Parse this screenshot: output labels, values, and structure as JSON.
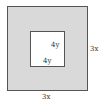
{
  "diagram": {
    "type": "nested-squares",
    "outer_square": {
      "side_label_right": "3x",
      "side_label_bottom": "3x",
      "fill": "#d9d9d9",
      "stroke": "#555555"
    },
    "inner_square": {
      "side_label_right": "4y",
      "side_label_bottom": "4y",
      "fill": "#ffffff",
      "stroke": "#555555"
    }
  }
}
